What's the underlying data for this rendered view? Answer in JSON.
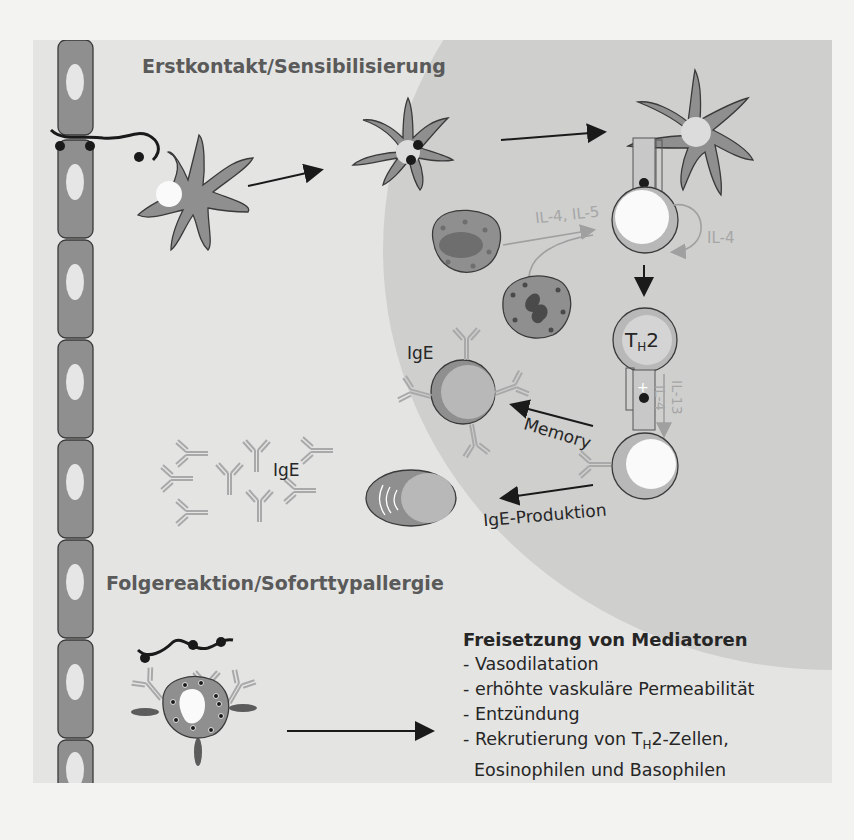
{
  "sections": {
    "sensitization_title": "Erstkontakt/Sensibilisierung",
    "reaction_title": "Folgereaktion/Soforttypallergie"
  },
  "labels": {
    "il4_il5": "IL-4, IL-5",
    "il4_autocrine": "IL-4",
    "th2_main": "T",
    "th2_sub": "H",
    "th2_suffix": "2",
    "il4_vertical": "IL-4",
    "il13_vertical": "IL-13",
    "ige_memory": "IgE",
    "ige_free": "IgE",
    "memory": "Memory",
    "ige_production": "IgE-Produktion"
  },
  "mediators": {
    "heading": "Freisetzung von Mediatoren",
    "items": [
      "- Vasodilatation",
      "- erhöhte vaskuläre Permeabilität",
      "- Entzündung"
    ],
    "recruitment_prefix": "- Rekrutierung von T",
    "recruitment_sub": "H",
    "recruitment_suffix": "2-Zellen,",
    "recruitment_line2": "Eosinophilen und Basophilen"
  },
  "colors": {
    "panel_bg": "#e4e4e3",
    "lymph_region": "#cfcfce",
    "cell_fill": "#8f8f8f",
    "cell_stroke": "#3a3a3a",
    "antibody": "#a9a9a9",
    "cytokine_text": "#a6a6a6",
    "text_dark": "#262626"
  }
}
